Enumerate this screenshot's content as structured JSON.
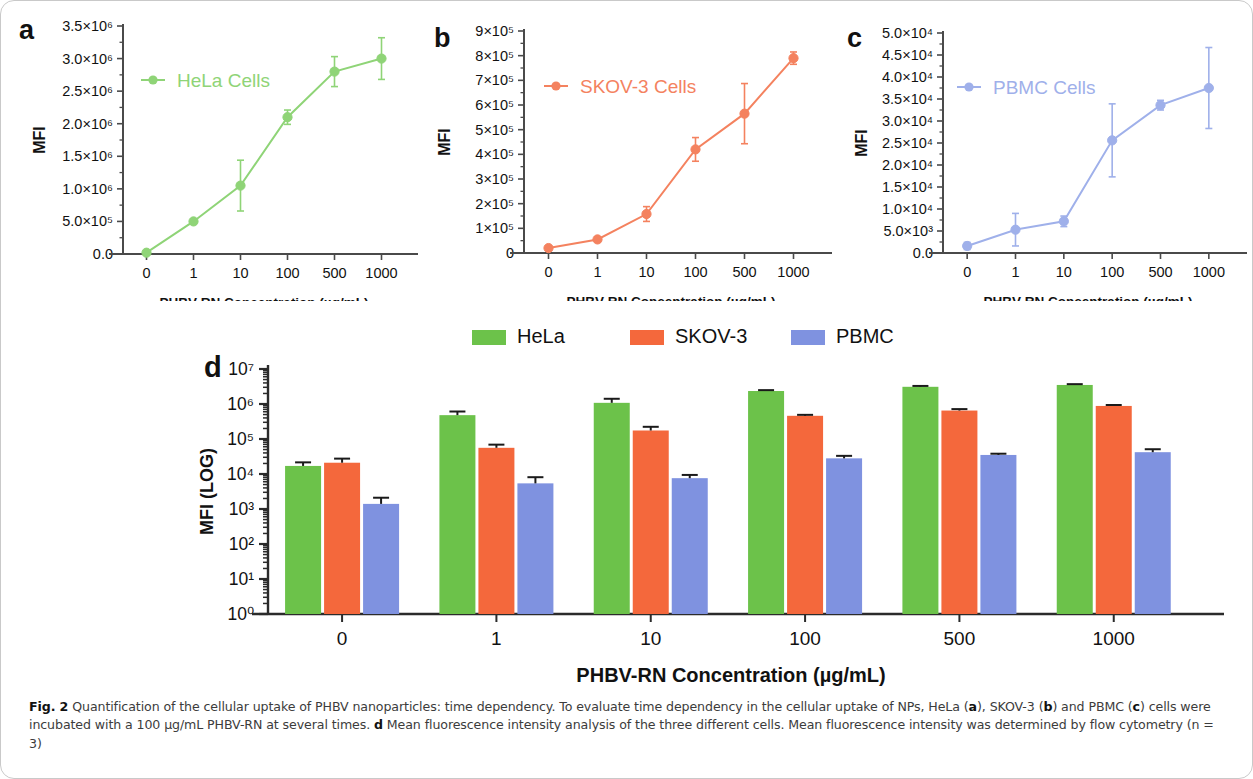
{
  "figure": {
    "label": "Fig. 2",
    "caption_text": " Quantification of the cellular uptake of PHBV nanoparticles: time dependency. To evaluate time dependency in the cellular uptake of NPs, HeLa (a), SKOV-3 (b) and PBMC (c) cells were incubated with a 100 µg/mL PHBV-RN at several times. d Mean fluorescence intensity analysis of the three different cells. Mean fluorescence intensity was determined by flow cytometry (n = 3)",
    "caption_parts": {
      "p1": " Quantification of the cellular uptake of PHBV nanoparticles: time dependency. To evaluate time dependency in the cellular uptake of NPs, HeLa (",
      "a": "a",
      "p2": "), SKOV-3 (",
      "b": "b",
      "p3": ") and PBMC (",
      "c": "c",
      "p4": ") cells were incubated with a 100 µg/mL PHBV-RN at several times. ",
      "d": "d",
      "p5": " Mean fluorescence intensity analysis of the three different cells. Mean fluorescence intensity was determined by flow cytometry (n = 3)"
    }
  },
  "colors": {
    "hela": "#6cc24a",
    "skov3": "#f4683c",
    "pbmc": "#7f92e0",
    "hela_line": "#8fd477",
    "skov3_line": "#f4825f",
    "pbmc_line": "#9fb0ea",
    "axis": "#4a4a4a",
    "text": "#111111"
  },
  "panels": {
    "a": {
      "letter": "a",
      "legend_label": "HeLa Cells",
      "ylabel": "MFI",
      "xlabel": "PHBV-RN Concentration (µg/mL)",
      "ytick_labels": [
        "3.5×10⁶",
        "3.0×10⁶",
        "2.5×10⁶",
        "2.0×10⁶",
        "1.5×10⁶",
        "1.0×10⁶",
        "5.0×10⁵",
        "0.0"
      ],
      "xtick_labels": [
        "0",
        "1",
        "10",
        "100",
        "500",
        "1000"
      ]
    },
    "b": {
      "letter": "b",
      "legend_label": "SKOV-3 Cells",
      "ylabel": "MFI",
      "xlabel": "PHBV-RN Concentration (µg/mL)",
      "ytick_labels": [
        "9×10⁵",
        "8×10⁵",
        "7×10⁵",
        "6×10⁵",
        "5×10⁵",
        "4×10⁵",
        "3×10⁵",
        "2×10⁵",
        "1×10⁵",
        "0"
      ],
      "xtick_labels": [
        "0",
        "1",
        "10",
        "100",
        "500",
        "1000"
      ]
    },
    "c": {
      "letter": "c",
      "legend_label": "PBMC Cells",
      "ylabel": "MFI",
      "xlabel": "PHBV-RN Concentration (µg/mL)",
      "ytick_labels": [
        "5.0×10⁴",
        "4.5×10⁴",
        "4.0×10⁴",
        "3.5×10⁴",
        "3.0×10⁴",
        "2.5×10⁴",
        "2.0×10⁴",
        "1.5×10⁴",
        "1.0×10⁴",
        "5.0×10³",
        "0.0"
      ],
      "xtick_labels": [
        "0",
        "1",
        "10",
        "100",
        "500",
        "1000"
      ]
    },
    "d": {
      "letter": "d",
      "ylabel": "MFI (LOG)",
      "xlabel": "PHBV-RN Concentration (µg/mL)",
      "ytick_labels": [
        "10⁷",
        "10⁶",
        "10⁵",
        "10⁴",
        "10³",
        "10²",
        "10¹",
        "10⁰"
      ],
      "xtick_labels": [
        "0",
        "1",
        "10",
        "100",
        "500",
        "1000"
      ],
      "legend": [
        {
          "name": "HeLa",
          "color": "#6cc24a"
        },
        {
          "name": "SKOV-3",
          "color": "#f4683c"
        },
        {
          "name": "PBMC",
          "color": "#7f92e0"
        }
      ]
    }
  },
  "chart_data": [
    {
      "type": "line",
      "panel": "a",
      "title": "HeLa Cells",
      "xlabel": "PHBV-RN Concentration (µg/mL)",
      "ylabel": "MFI",
      "categories": [
        "0",
        "1",
        "10",
        "100",
        "500",
        "1000"
      ],
      "values": [
        20000,
        500000,
        1050000,
        2100000,
        2800000,
        3000000
      ],
      "errors": [
        20000,
        40000,
        390000,
        110000,
        230000,
        320000
      ],
      "ylim": [
        0,
        3500000
      ],
      "ytick_values": [
        0,
        500000,
        1000000,
        1500000,
        2000000,
        2500000,
        3000000,
        3500000
      ],
      "grid": false,
      "legend_position": "upper-left",
      "color": "#8fd477"
    },
    {
      "type": "line",
      "panel": "b",
      "title": "SKOV-3 Cells",
      "xlabel": "PHBV-RN Concentration (µg/mL)",
      "ylabel": "MFI",
      "categories": [
        "0",
        "1",
        "10",
        "100",
        "500",
        "1000"
      ],
      "values": [
        20000,
        55000,
        158000,
        420000,
        565000,
        790000
      ],
      "errors": [
        8000,
        10000,
        30000,
        48000,
        122000,
        25000
      ],
      "ylim": [
        0,
        900000
      ],
      "ytick_values": [
        0,
        100000,
        200000,
        300000,
        400000,
        500000,
        600000,
        700000,
        800000,
        900000
      ],
      "grid": false,
      "legend_position": "upper-left",
      "color": "#f4825f"
    },
    {
      "type": "line",
      "panel": "c",
      "title": "PBMC Cells",
      "xlabel": "PHBV-RN Concentration (µg/mL)",
      "ylabel": "MFI",
      "categories": [
        "0",
        "1",
        "10",
        "100",
        "500",
        "1000"
      ],
      "values": [
        1600,
        5300,
        7200,
        25600,
        33600,
        37500
      ],
      "errors": [
        800,
        3700,
        1200,
        8300,
        1100,
        9200
      ],
      "ylim": [
        0,
        50000
      ],
      "ytick_values": [
        0,
        5000,
        10000,
        15000,
        20000,
        25000,
        30000,
        35000,
        40000,
        45000,
        50000
      ],
      "grid": false,
      "legend_position": "upper-left",
      "color": "#9fb0ea"
    },
    {
      "type": "bar",
      "panel": "d",
      "title": "",
      "xlabel": "PHBV-RN Concentration (µg/mL)",
      "ylabel": "MFI (LOG)",
      "yscale": "log",
      "categories": [
        "0",
        "1",
        "10",
        "100",
        "500",
        "1000"
      ],
      "ylim": [
        1,
        10000000
      ],
      "ytick_values": [
        1,
        10,
        100,
        1000,
        10000,
        100000,
        1000000,
        10000000
      ],
      "grid": false,
      "legend_position": "top",
      "series": [
        {
          "name": "HeLa",
          "color": "#6cc24a",
          "values": [
            17000,
            480000,
            1080000,
            2350000,
            3100000,
            3500000
          ],
          "errors": [
            4500,
            130000,
            330000,
            140000,
            180000,
            190000
          ]
        },
        {
          "name": "SKOV-3",
          "color": "#f4683c",
          "values": [
            21000,
            56000,
            175000,
            460000,
            650000,
            880000
          ],
          "errors": [
            6500,
            13000,
            48000,
            30000,
            65000,
            55000
          ]
        },
        {
          "name": "PBMC",
          "color": "#7f92e0",
          "values": [
            1400,
            5400,
            7600,
            28000,
            35000,
            42000
          ],
          "errors": [
            700,
            2700,
            1800,
            5000,
            3000,
            9000
          ]
        }
      ]
    }
  ]
}
